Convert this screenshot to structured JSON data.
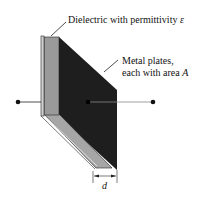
{
  "diagram": {
    "type": "parallel-plate capacitor",
    "labels": {
      "dielectric": "Dielectric with permittivity ",
      "dielectric_symbol": "ε",
      "plates_line1": "Metal plates,",
      "plates_line2": "each with area ",
      "plates_symbol": "A",
      "separation": "d"
    },
    "colors": {
      "plate": "#1e1e1e",
      "dielectric": "#9a9a9a",
      "dielectric_edge": "#c8c8c8",
      "line": "#222222"
    }
  }
}
